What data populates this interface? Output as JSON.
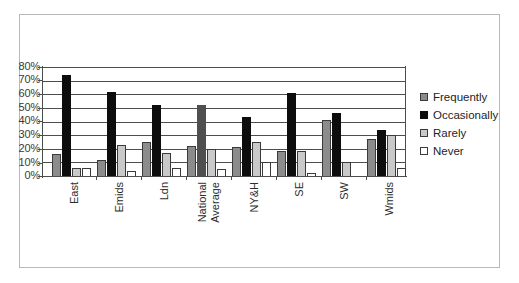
{
  "chart_data": {
    "type": "bar",
    "title": "",
    "subtitle": "",
    "xlabel": "",
    "ylabel": "",
    "ylim": [
      0,
      80
    ],
    "yticks": [
      "0%",
      "10%",
      "20%",
      "30%",
      "40%",
      "50%",
      "60%",
      "70%",
      "80%"
    ],
    "ytick_values": [
      0,
      10,
      20,
      30,
      40,
      50,
      60,
      70,
      80
    ],
    "grid": true,
    "legend_position": "right",
    "categories": [
      "East",
      "Emids",
      "Ldn",
      "National Average",
      "NY&H",
      "SE",
      "SW",
      "Wmids"
    ],
    "category_lines": [
      [
        "East"
      ],
      [
        "Emids"
      ],
      [
        "Ldn"
      ],
      [
        "National",
        "Average"
      ],
      [
        "NY&H"
      ],
      [
        "SE"
      ],
      [
        "SW"
      ],
      [
        "Wmids"
      ]
    ],
    "series": [
      {
        "name": "Frequently",
        "color": "#8c8c8c",
        "values": [
          16,
          12,
          25,
          22,
          21,
          18,
          41,
          27
        ]
      },
      {
        "name": "Occasionally",
        "color": "#0d0d0d",
        "values": [
          74,
          62,
          52,
          52,
          43,
          61,
          46,
          34
        ]
      },
      {
        "name": "Rarely",
        "color": "#c9c9c9",
        "values": [
          6,
          23,
          17,
          20,
          25,
          18,
          10,
          30
        ]
      },
      {
        "name": "Never",
        "color": "#ffffff",
        "values": [
          6,
          4,
          6,
          5,
          10,
          2,
          0,
          6
        ]
      }
    ]
  },
  "legend": {
    "items": [
      {
        "label": "Frequently"
      },
      {
        "label": "Occasionally"
      },
      {
        "label": "Rarely"
      },
      {
        "label": "Never"
      }
    ]
  }
}
